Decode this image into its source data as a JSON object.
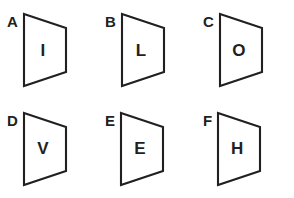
{
  "page": {
    "background_color": "#ffffff",
    "stroke_color": "#231f20",
    "rows": 2,
    "columns": 3
  },
  "figures": [
    {
      "label": "A",
      "letter": "I",
      "shape": "trapezoid",
      "orientation": "left-edge-tall-right-edge-short"
    },
    {
      "label": "B",
      "letter": "L",
      "shape": "trapezoid",
      "orientation": "left-edge-tall-right-edge-short"
    },
    {
      "label": "C",
      "letter": "O",
      "shape": "trapezoid",
      "orientation": "left-edge-tall-right-edge-short"
    },
    {
      "label": "D",
      "letter": "V",
      "shape": "trapezoid",
      "orientation": "left-edge-tall-right-edge-short"
    },
    {
      "label": "E",
      "letter": "E",
      "shape": "trapezoid",
      "orientation": "left-edge-tall-right-edge-short"
    },
    {
      "label": "F",
      "letter": "H",
      "shape": "trapezoid",
      "orientation": "left-edge-tall-right-edge-short"
    }
  ]
}
